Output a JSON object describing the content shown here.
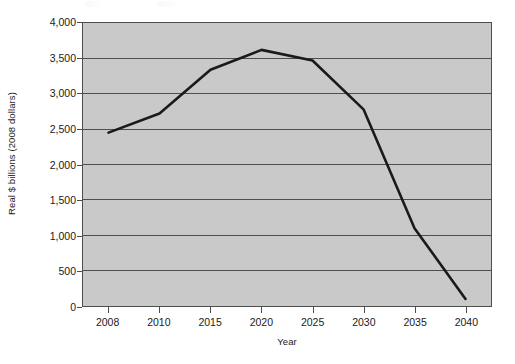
{
  "chart_data": {
    "type": "line",
    "title": "",
    "xlabel": "Year",
    "ylabel": "Real $ billions (2008 dollars)",
    "categories": [
      "2008",
      "2010",
      "2015",
      "2020",
      "2025",
      "2030",
      "2035",
      "2040"
    ],
    "values": [
      2450,
      2720,
      3340,
      3620,
      3470,
      2780,
      1100,
      100
    ],
    "series": [
      {
        "name": "Real $ billions (2008 dollars)",
        "values": [
          2450,
          2720,
          3340,
          3620,
          3470,
          2780,
          1100,
          100
        ]
      }
    ],
    "ylim": [
      0,
      4000
    ],
    "yticks": [
      0,
      500,
      1000,
      1500,
      2000,
      2500,
      3000,
      3500,
      4000
    ],
    "ytick_labels": [
      "0",
      "500",
      "1,000",
      "1,500",
      "2,000",
      "2,500",
      "3,000",
      "3,500",
      "4,000"
    ],
    "xtick_labels": [
      "2008",
      "2010",
      "2015",
      "2020",
      "2025",
      "2030",
      "2035",
      "2040"
    ],
    "grid": "horizontal",
    "legend": "none",
    "line_color": "#1a1a1a",
    "plot_background_color": "#c9c9c9",
    "gridline_color": "#4d4d4d",
    "axis_color": "#4d4d4d",
    "figure_background_color": "#ffffff"
  }
}
